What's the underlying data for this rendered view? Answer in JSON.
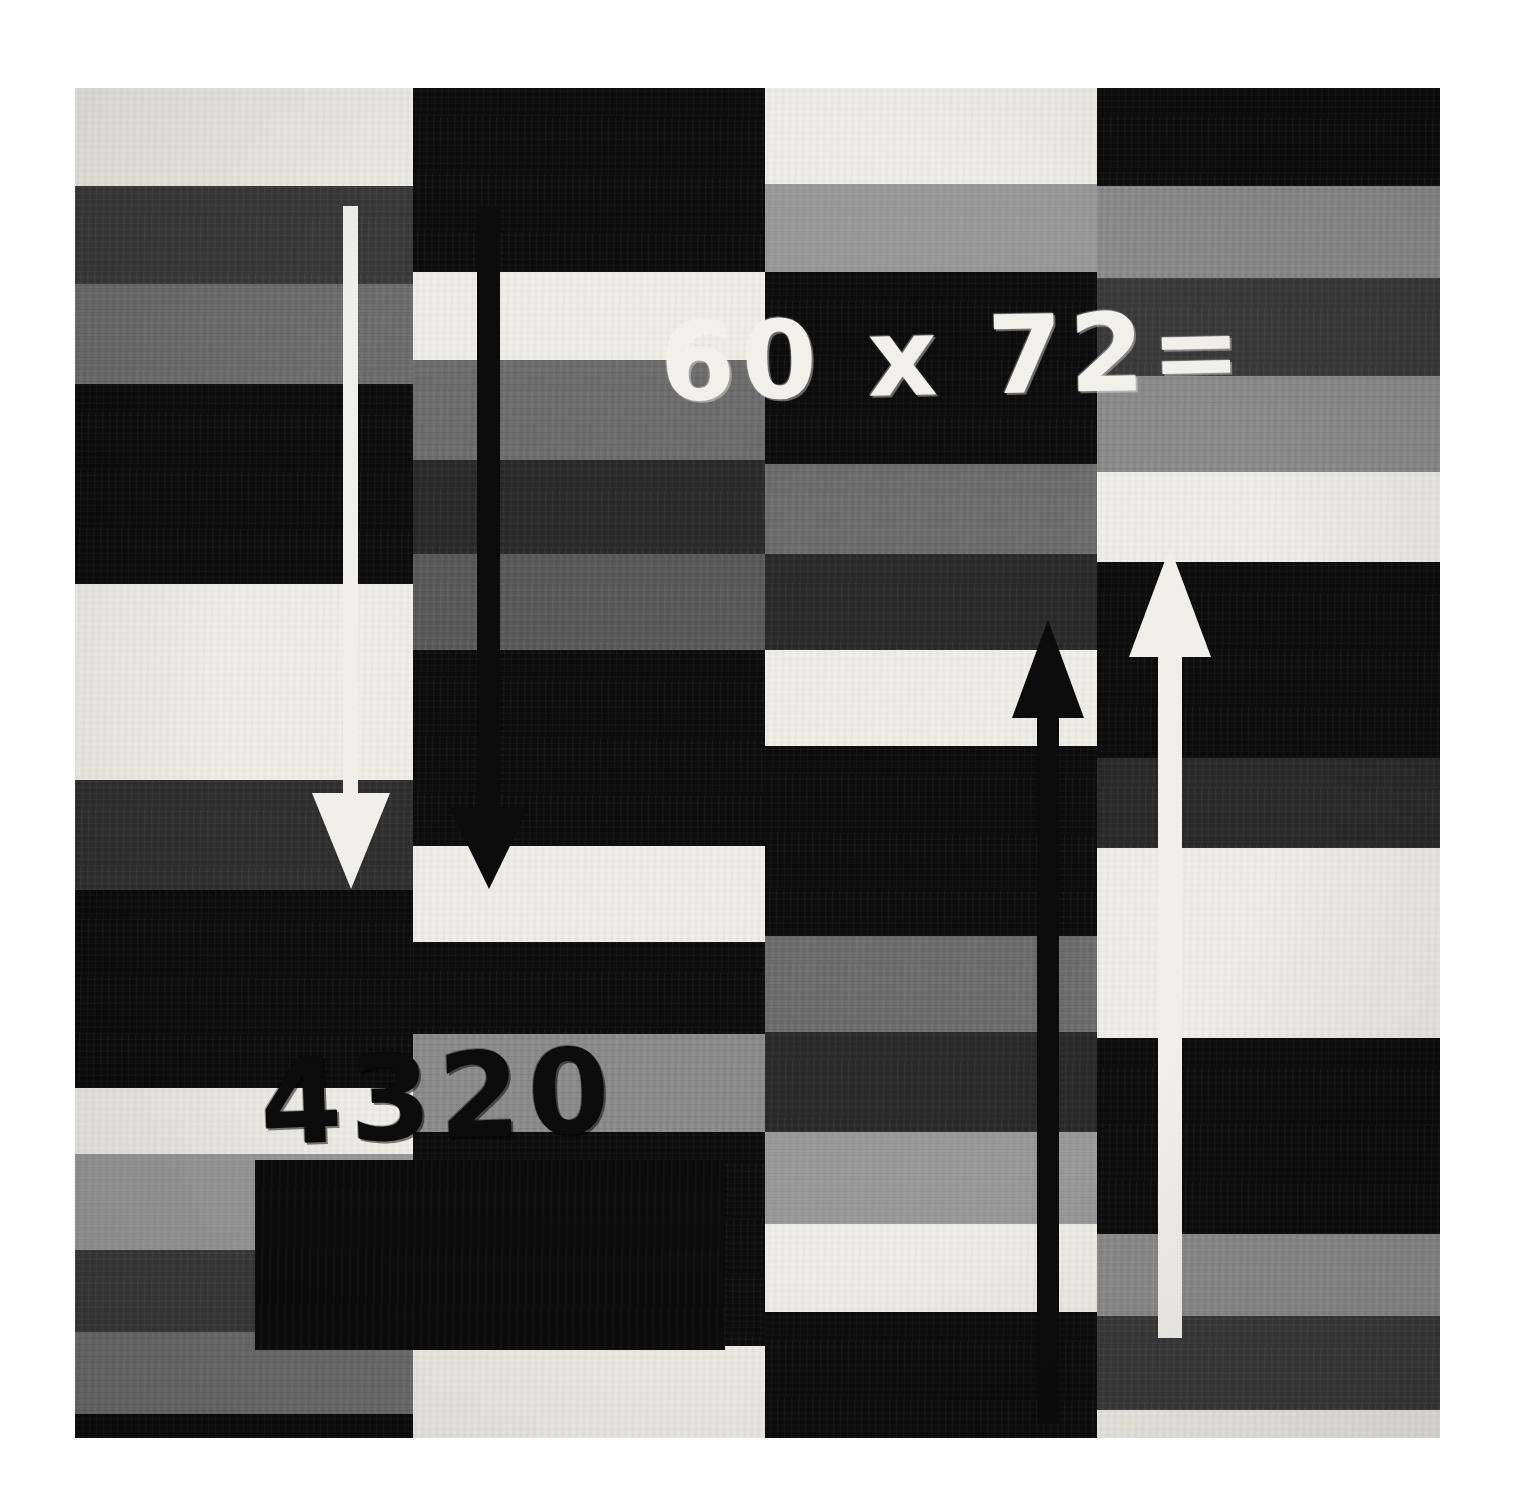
{
  "artwork": {
    "title": "60 x 72=",
    "equation_text": "60 x 72=",
    "answer_text": "4320",
    "multiplicand": "60",
    "multiplier": "72",
    "operator": "x",
    "equals": "=",
    "product": "4320",
    "palette": {
      "black": "#0b0b0b",
      "dark_gray": "#3a3a3a",
      "mid_gray": "#6e6e6e",
      "light_gray": "#9a9a9a",
      "white": "#f1efe9",
      "page": "#ffffff"
    },
    "plate": {
      "left": 75,
      "top": 88,
      "width": 1365,
      "height": 1350
    },
    "columns": [
      {
        "name": "column-1",
        "x": 0,
        "width": 338,
        "bands": [
          {
            "color": "#f1efe9",
            "top": 0,
            "height": 98
          },
          {
            "color": "#3a3a3a",
            "top": 98,
            "height": 98
          },
          {
            "color": "#6e6e6e",
            "top": 196,
            "height": 100
          },
          {
            "color": "#0b0b0b",
            "top": 296,
            "height": 200
          },
          {
            "color": "#f1efe9",
            "top": 496,
            "height": 196
          },
          {
            "color": "#2f2f2f",
            "top": 692,
            "height": 110
          },
          {
            "color": "#0b0b0b",
            "top": 802,
            "height": 198
          },
          {
            "color": "#f1efe9",
            "top": 1000,
            "height": 66
          },
          {
            "color": "#9a9a9a",
            "top": 1066,
            "height": 96
          },
          {
            "color": "#3a3a3a",
            "top": 1162,
            "height": 82
          },
          {
            "color": "#6e6e6e",
            "top": 1244,
            "height": 82
          },
          {
            "color": "#0b0b0b",
            "top": 1326,
            "height": 24
          }
        ]
      },
      {
        "name": "column-2",
        "x": 338,
        "width": 352,
        "bands": [
          {
            "color": "#0b0b0b",
            "top": 0,
            "height": 184
          },
          {
            "color": "#f1efe9",
            "top": 184,
            "height": 88
          },
          {
            "color": "#6e6e6e",
            "top": 272,
            "height": 100
          },
          {
            "color": "#2a2a2a",
            "top": 372,
            "height": 94
          },
          {
            "color": "#5a5a5a",
            "top": 466,
            "height": 96
          },
          {
            "color": "#0b0b0b",
            "top": 562,
            "height": 196
          },
          {
            "color": "#f1efe9",
            "top": 758,
            "height": 96
          },
          {
            "color": "#0b0b0b",
            "top": 854,
            "height": 92
          },
          {
            "color": "#8d8d8d",
            "top": 946,
            "height": 98
          },
          {
            "color": "#0b0b0b",
            "top": 1044,
            "height": 214
          },
          {
            "color": "#f1efe9",
            "top": 1258,
            "height": 92
          }
        ]
      },
      {
        "name": "column-3",
        "x": 690,
        "width": 332,
        "bands": [
          {
            "color": "#f1efe9",
            "top": 0,
            "height": 96
          },
          {
            "color": "#9a9a9a",
            "top": 96,
            "height": 88
          },
          {
            "color": "#0b0b0b",
            "top": 184,
            "height": 192
          },
          {
            "color": "#6e6e6e",
            "top": 376,
            "height": 90
          },
          {
            "color": "#2a2a2a",
            "top": 466,
            "height": 96
          },
          {
            "color": "#f1efe9",
            "top": 562,
            "height": 96
          },
          {
            "color": "#0b0b0b",
            "top": 658,
            "height": 190
          },
          {
            "color": "#6e6e6e",
            "top": 848,
            "height": 96
          },
          {
            "color": "#2a2a2a",
            "top": 944,
            "height": 100
          },
          {
            "color": "#9a9a9a",
            "top": 1044,
            "height": 92
          },
          {
            "color": "#f1efe9",
            "top": 1136,
            "height": 88
          },
          {
            "color": "#0b0b0b",
            "top": 1224,
            "height": 126
          }
        ]
      },
      {
        "name": "column-4",
        "x": 1022,
        "width": 343,
        "bands": [
          {
            "color": "#0b0b0b",
            "top": 0,
            "height": 98
          },
          {
            "color": "#8d8d8d",
            "top": 98,
            "height": 92
          },
          {
            "color": "#3a3a3a",
            "top": 190,
            "height": 98
          },
          {
            "color": "#8d8d8d",
            "top": 288,
            "height": 96
          },
          {
            "color": "#f1efe9",
            "top": 384,
            "height": 90
          },
          {
            "color": "#0b0b0b",
            "top": 474,
            "height": 196
          },
          {
            "color": "#2a2a2a",
            "top": 670,
            "height": 90
          },
          {
            "color": "#f1efe9",
            "top": 760,
            "height": 190
          },
          {
            "color": "#0b0b0b",
            "top": 950,
            "height": 196
          },
          {
            "color": "#8d8d8d",
            "top": 1146,
            "height": 82
          },
          {
            "color": "#3a3a3a",
            "top": 1228,
            "height": 94
          },
          {
            "color": "#f1efe9",
            "top": 1322,
            "height": 28
          }
        ]
      }
    ],
    "arrows": [
      {
        "name": "arrow-down-white-left",
        "direction": "down",
        "color": "#f1efe9",
        "shaft_x": 268,
        "shaft_top": 118,
        "shaft_width": 15,
        "shaft_height": 640,
        "head_width": 78,
        "head_height": 96
      },
      {
        "name": "arrow-down-black-inner",
        "direction": "down",
        "color": "#0b0b0b",
        "shaft_x": 402,
        "shaft_top": 118,
        "shaft_width": 23,
        "shaft_height": 646,
        "head_width": 80,
        "head_height": 82
      },
      {
        "name": "arrow-up-black-right",
        "direction": "up",
        "color": "#0b0b0b",
        "shaft_x": 962,
        "shaft_top": 576,
        "shaft_width": 22,
        "shaft_height": 760,
        "head_width": 72,
        "head_height": 98
      },
      {
        "name": "arrow-up-white-far-right",
        "direction": "up",
        "color": "#f1efe9",
        "shaft_x": 1083,
        "shaft_top": 508,
        "shaft_width": 24,
        "shaft_height": 742,
        "head_width": 82,
        "head_height": 110
      }
    ]
  }
}
